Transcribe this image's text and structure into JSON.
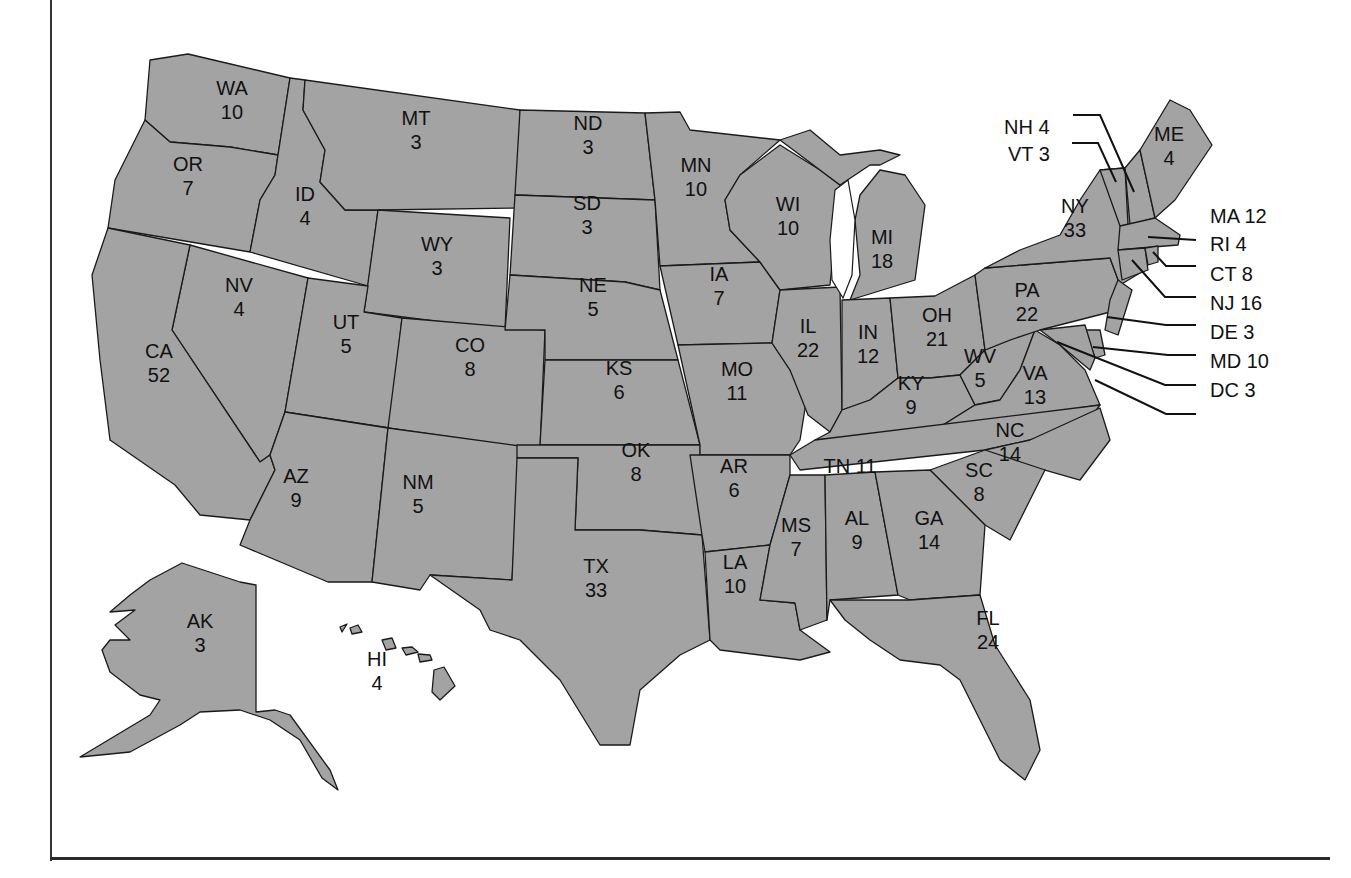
{
  "map": {
    "fill_color": "#a3a3a3",
    "border_color": "#1a1a1a",
    "background": "#ffffff",
    "states": [
      {
        "abbr": "WA",
        "votes": "10",
        "x": 232,
        "y": 100
      },
      {
        "abbr": "OR",
        "votes": "7",
        "x": 188,
        "y": 176
      },
      {
        "abbr": "ID",
        "votes": "4",
        "x": 305,
        "y": 206
      },
      {
        "abbr": "MT",
        "votes": "3",
        "x": 416,
        "y": 130
      },
      {
        "abbr": "WY",
        "votes": "3",
        "x": 437,
        "y": 256
      },
      {
        "abbr": "NV",
        "votes": "4",
        "x": 239,
        "y": 297
      },
      {
        "abbr": "UT",
        "votes": "5",
        "x": 346,
        "y": 334
      },
      {
        "abbr": "CO",
        "votes": "8",
        "x": 470,
        "y": 357
      },
      {
        "abbr": "CA",
        "votes": "52",
        "x": 159,
        "y": 363
      },
      {
        "abbr": "AZ",
        "votes": "9",
        "x": 296,
        "y": 488
      },
      {
        "abbr": "NM",
        "votes": "5",
        "x": 418,
        "y": 494
      },
      {
        "abbr": "ND",
        "votes": "3",
        "x": 588,
        "y": 135
      },
      {
        "abbr": "SD",
        "votes": "3",
        "x": 587,
        "y": 215
      },
      {
        "abbr": "NE",
        "votes": "5",
        "x": 593,
        "y": 297
      },
      {
        "abbr": "KS",
        "votes": "6",
        "x": 619,
        "y": 380
      },
      {
        "abbr": "OK",
        "votes": "8",
        "x": 636,
        "y": 462
      },
      {
        "abbr": "TX",
        "votes": "33",
        "x": 596,
        "y": 578
      },
      {
        "abbr": "MN",
        "votes": "10",
        "x": 696,
        "y": 177
      },
      {
        "abbr": "IA",
        "votes": "7",
        "x": 719,
        "y": 286
      },
      {
        "abbr": "MO",
        "votes": "11",
        "x": 737,
        "y": 381
      },
      {
        "abbr": "AR",
        "votes": "6",
        "x": 734,
        "y": 478
      },
      {
        "abbr": "LA",
        "votes": "10",
        "x": 735,
        "y": 574
      },
      {
        "abbr": "WI",
        "votes": "10",
        "x": 788,
        "y": 216
      },
      {
        "abbr": "IL",
        "votes": "22",
        "x": 808,
        "y": 338
      },
      {
        "abbr": "MI",
        "votes": "18",
        "x": 882,
        "y": 249
      },
      {
        "abbr": "IN",
        "votes": "12",
        "x": 868,
        "y": 344
      },
      {
        "abbr": "OH",
        "votes": "21",
        "x": 937,
        "y": 327
      },
      {
        "abbr": "KY",
        "votes": "9",
        "x": 911,
        "y": 395
      },
      {
        "abbr": "WV",
        "votes": "5",
        "x": 980,
        "y": 368
      },
      {
        "abbr": "VA",
        "votes": "13",
        "x": 1035,
        "y": 385
      },
      {
        "abbr": "MS",
        "votes": "7",
        "x": 796,
        "y": 537
      },
      {
        "abbr": "AL",
        "votes": "9",
        "x": 857,
        "y": 530
      },
      {
        "abbr": "GA",
        "votes": "14",
        "x": 929,
        "y": 530
      },
      {
        "abbr": "SC",
        "votes": "8",
        "x": 979,
        "y": 482
      },
      {
        "abbr": "NC",
        "votes": "14",
        "x": 1010,
        "y": 442
      },
      {
        "abbr": "FL",
        "votes": "24",
        "x": 988,
        "y": 630
      },
      {
        "abbr": "PA",
        "votes": "22",
        "x": 1027,
        "y": 302
      },
      {
        "abbr": "NY",
        "votes": "33",
        "x": 1075,
        "y": 218
      },
      {
        "abbr": "ME",
        "votes": "4",
        "x": 1169,
        "y": 146
      },
      {
        "abbr": "AK",
        "votes": "3",
        "x": 200,
        "y": 633
      },
      {
        "abbr": "HI",
        "votes": "4",
        "x": 377,
        "y": 671
      }
    ],
    "tn_label": "TN 11",
    "callouts": [
      {
        "text": "NH 4",
        "x": 1004,
        "y": 139
      },
      {
        "text": "VT 3",
        "x": 1008,
        "y": 166
      },
      {
        "text": "MA 12",
        "x": 1210,
        "y": 228
      },
      {
        "text": "RI 4",
        "x": 1210,
        "y": 256
      },
      {
        "text": "CT 8",
        "x": 1210,
        "y": 286
      },
      {
        "text": "NJ 16",
        "x": 1210,
        "y": 315
      },
      {
        "text": "DE 3",
        "x": 1210,
        "y": 344
      },
      {
        "text": "MD 10",
        "x": 1210,
        "y": 373
      },
      {
        "text": "DC 3",
        "x": 1210,
        "y": 402
      }
    ]
  }
}
